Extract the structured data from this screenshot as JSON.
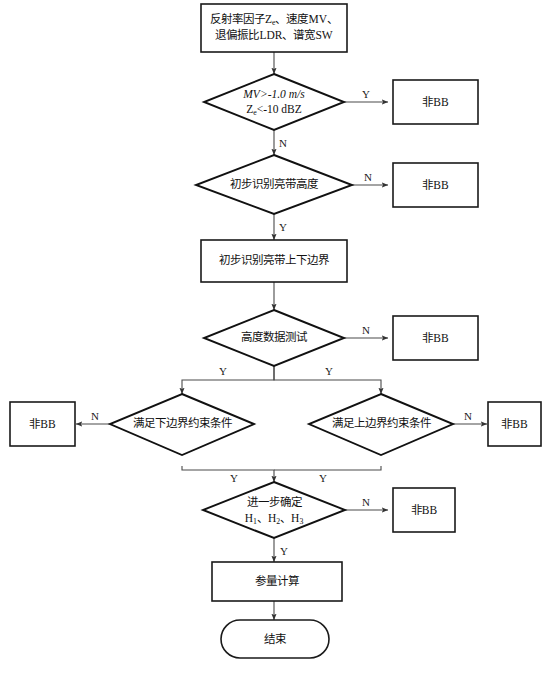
{
  "diagram": {
    "language": "zh-CN",
    "type": "flowchart",
    "colors": {
      "background": "#ffffff",
      "node_stroke": "#111111",
      "connector_stroke": "#4a4a4a",
      "text": "#111111"
    },
    "nodes": {
      "input_params": {
        "shape": "rectangle",
        "line1": "反射率因子Z",
        "line1_sub": "e",
        "line1_tail": "、速度MV、",
        "line2": "退偏振比LDR、谱宽SW"
      },
      "decision_mv_ze": {
        "shape": "diamond",
        "line1": "MV>-1.0 m/s",
        "line2_pre": "Z",
        "line2_sub": "e",
        "line2_post": "<-10 dBZ"
      },
      "decision_bb_height": {
        "shape": "diamond",
        "label": "初步识别亮带高度"
      },
      "process_bb_bounds": {
        "shape": "rectangle",
        "label": "初步识别亮带上下边界"
      },
      "decision_height_test": {
        "shape": "diamond",
        "label": "高度数据测试"
      },
      "decision_lower_bound": {
        "shape": "diamond",
        "label": "满足下边界约束条件"
      },
      "decision_upper_bound": {
        "shape": "diamond",
        "label": "满足上边界约束条件"
      },
      "decision_confirm_h": {
        "shape": "diamond",
        "line1": "进一步确定",
        "line2_h1": "H",
        "line2_h1sub": "1",
        "line2_sep1": "、",
        "line2_h2": "H",
        "line2_h2sub": "2",
        "line2_sep2": "、",
        "line2_h3": "H",
        "line2_h3sub": "3"
      },
      "process_param_calc": {
        "shape": "rectangle",
        "label": "参量计算"
      },
      "terminator_end": {
        "shape": "rounded-rectangle",
        "label": "结束"
      },
      "reject_1": {
        "shape": "rectangle",
        "label": "非BB"
      },
      "reject_2": {
        "shape": "rectangle",
        "label": "非BB"
      },
      "reject_3": {
        "shape": "rectangle",
        "label": "非BB"
      },
      "reject_4": {
        "shape": "rectangle",
        "label": "非BB"
      },
      "reject_5": {
        "shape": "rectangle",
        "label": "非BB"
      },
      "reject_6": {
        "shape": "rectangle",
        "label": "非BB"
      }
    },
    "edge_labels": {
      "mv_ze_yes": "Y",
      "mv_ze_no": "N",
      "bb_height_no": "N",
      "bb_height_yes": "Y",
      "height_test_no": "N",
      "height_test_yes_left": "Y",
      "height_test_yes_right": "Y",
      "lower_bound_no": "N",
      "upper_bound_no": "N",
      "lower_bound_yes": "Y",
      "upper_bound_yes": "Y",
      "confirm_h_no": "N",
      "confirm_h_yes": "Y"
    }
  }
}
